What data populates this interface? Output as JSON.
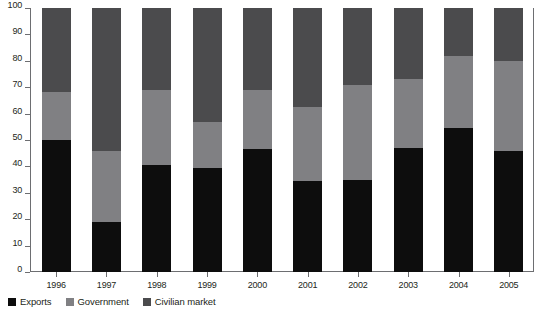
{
  "chart_data": {
    "type": "bar",
    "subtype": "stacked-bar-100",
    "title": "",
    "xlabel": "",
    "ylabel": "",
    "ylim": [
      0,
      100
    ],
    "ytick_step": 10,
    "yticks": [
      0,
      10,
      20,
      30,
      40,
      50,
      60,
      70,
      80,
      90,
      100
    ],
    "grid": false,
    "legend_position": "bottom-left",
    "categories": [
      "1996",
      "1997",
      "1998",
      "1999",
      "2000",
      "2001",
      "2002",
      "2003",
      "2004",
      "2005"
    ],
    "series": [
      {
        "name": "Exports",
        "color": "#0d0d0d",
        "values": [
          50,
          19,
          40.5,
          39.5,
          46.5,
          34.5,
          35,
          47,
          54.5,
          46
        ]
      },
      {
        "name": "Government",
        "color": "#808083",
        "values": [
          18,
          27,
          28.5,
          17.5,
          22.5,
          28,
          36,
          26,
          27.5,
          34
        ]
      },
      {
        "name": "Civilian market",
        "color": "#4b4b4d",
        "values": [
          32,
          54,
          31,
          43,
          31,
          37.5,
          29,
          27,
          18,
          20
        ]
      }
    ],
    "cumulative_tops": {
      "Exports": [
        50,
        19,
        40.5,
        39.5,
        46.5,
        34.5,
        35,
        47,
        54.5,
        46
      ],
      "Government": [
        68,
        46,
        69,
        57,
        69,
        62.5,
        71,
        73,
        82,
        80
      ],
      "Civilian market": [
        100,
        100,
        100,
        100,
        100,
        100,
        100,
        100,
        100,
        100
      ]
    }
  },
  "axis": {
    "y_tick_labels": [
      "100",
      "90",
      "80",
      "70",
      "60",
      "50",
      "40",
      "30",
      "20",
      "10",
      "0"
    ],
    "x_tick_labels": [
      "1996",
      "1997",
      "1998",
      "1999",
      "2000",
      "2001",
      "2002",
      "2003",
      "2004",
      "2005"
    ]
  },
  "legend": {
    "items": [
      {
        "label": "Exports",
        "color": "#0d0d0d"
      },
      {
        "label": "Government",
        "color": "#808083"
      },
      {
        "label": "Civilian market",
        "color": "#4b4b4d"
      }
    ]
  },
  "colors": {
    "exports": "#0d0d0d",
    "government": "#808083",
    "civilian_market": "#4b4b4d",
    "axis": "#6d6e71",
    "text": "#231f20",
    "background": "#ffffff"
  }
}
